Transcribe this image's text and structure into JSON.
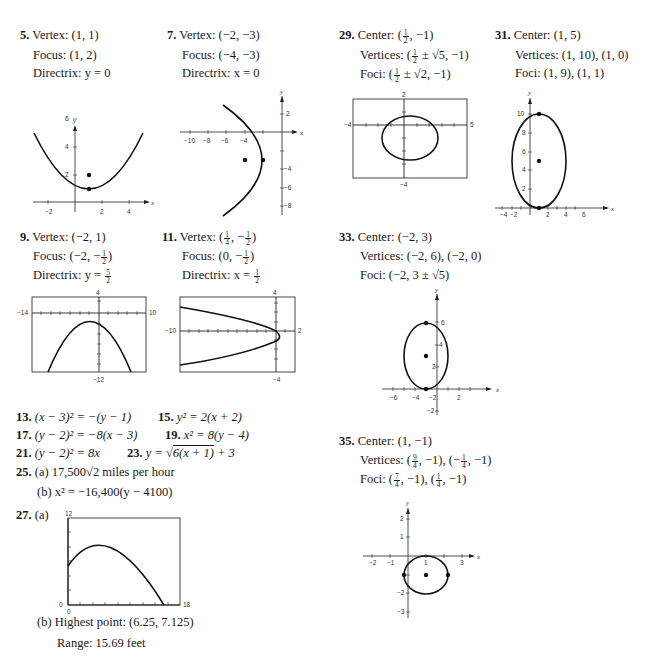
{
  "problems": {
    "p5": {
      "num": "5.",
      "l1": "Vertex: (1, 1)",
      "l2": "Focus: (1, 2)",
      "l3": "Directrix: y = 0"
    },
    "p7": {
      "num": "7.",
      "l1": "Vertex: (−2, −3)",
      "l2": "Focus: (−4, −3)",
      "l3": "Directrix: x = 0"
    },
    "p9": {
      "num": "9.",
      "l1": "Vertex: (−2, 1)",
      "l2_pre": "Focus: (−2, −",
      "l2_fn": "1",
      "l2_fd": "2",
      "l2_post": ")",
      "l3_pre": "Directrix: y = ",
      "l3_fn": "5",
      "l3_fd": "2"
    },
    "p11": {
      "num": "11.",
      "l1_pre": "Vertex: (",
      "l1_fn": "1",
      "l1_fd": "4",
      "l1_mid": ", −",
      "l1_fn2": "1",
      "l1_fd2": "2",
      "l1_post": ")",
      "l2_pre": "Focus: (0, −",
      "l2_fn": "1",
      "l2_fd": "2",
      "l2_post": ")",
      "l3_pre": "Directrix: x = ",
      "l3_fn": "1",
      "l3_fd": "2"
    },
    "p13": {
      "num": "13.",
      "text": "(x − 3)² = −(y − 1)"
    },
    "p15": {
      "num": "15.",
      "text": "y² = 2(x + 2)"
    },
    "p17": {
      "num": "17.",
      "text": "(y − 2)² = −8(x − 3)"
    },
    "p19": {
      "num": "19.",
      "text": "x² = 8(y − 4)"
    },
    "p21": {
      "num": "21.",
      "text": "(y − 2)² = 8x"
    },
    "p23": {
      "num": "23.",
      "pre": "y = √",
      "rad": "6(x + 1)",
      "post": " + 3"
    },
    "p25": {
      "num": "25.",
      "a": "(a)  17,500√2 miles per hour",
      "b": "(b)  x² = −16,400(y − 4100)"
    },
    "p27": {
      "num": "27.",
      "a": "(a)",
      "b1": "(b)  Highest point:  (6.25, 7.125)",
      "b2": "Range: 15.69 feet"
    },
    "p29": {
      "num": "29.",
      "l1_pre": "Center: (",
      "l1_fn": "1",
      "l1_fd": "2",
      "l1_post": ", −1)",
      "l2_pre": "Vertices: (",
      "l2_fn": "1",
      "l2_fd": "2",
      "l2_post": " ± √5, −1)",
      "l3_pre": "Foci: (",
      "l3_fn": "1",
      "l3_fd": "2",
      "l3_post": " ± √2, −1)"
    },
    "p31": {
      "num": "31.",
      "l1": "Center: (1, 5)",
      "l2": "Vertices: (1, 10),  (1, 0)",
      "l3": "Foci: (1, 9),  (1, 1)"
    },
    "p33": {
      "num": "33.",
      "l1": "Center: (−2, 3)",
      "l2": "Vertices: (−2, 6),  (−2, 0)",
      "l3": "Foci: (−2, 3 ± √5)"
    },
    "p35": {
      "num": "35.",
      "l1": "Center: (1, −1)",
      "l2_pre": "Vertices: (",
      "l2_fn": "9",
      "l2_fd": "4",
      "l2_mid": ", −1),  (−",
      "l2_fn2": "1",
      "l2_fd2": "4",
      "l2_post": ", −1)",
      "l3_pre": "Foci: (",
      "l3_fn": "7",
      "l3_fd": "4",
      "l3_mid": ", −1),  (",
      "l3_fn2": "1",
      "l3_fd2": "4",
      "l3_post": ", −1)"
    }
  },
  "graphs": {
    "g5": {
      "y_ticks": [
        "6",
        "4",
        "2"
      ],
      "x_ticks": [
        "−2",
        "2",
        "4"
      ],
      "xl": "x",
      "yl": "y"
    },
    "g7": {
      "y_ticks": [
        "2",
        "−4",
        "−6",
        "−8"
      ],
      "x_ticks": [
        "−10",
        "−8",
        "−6",
        "−4"
      ],
      "xl": "x",
      "yl": "y"
    },
    "g9": {
      "top": "4",
      "left": "−14",
      "right": "10",
      "bottom": "−12"
    },
    "g11": {
      "top": "4",
      "left": "−10",
      "right": "2",
      "bottom": "−4"
    },
    "g27": {
      "top": "12",
      "left": "0",
      "right": "18",
      "bottom": "0"
    },
    "g29": {
      "top": "2",
      "left": "−4",
      "right": "5",
      "bottom": "−4"
    },
    "g31": {
      "y_ticks": [
        "10",
        "8",
        "6",
        "4",
        "2"
      ],
      "x_ticks": [
        "−4",
        "−2",
        "2",
        "4",
        "6"
      ],
      "xl": "x",
      "yl": "y"
    },
    "g33": {
      "y_ticks": [
        "6",
        "4",
        "2",
        "−2"
      ],
      "x_ticks": [
        "−6",
        "−4",
        "−2",
        "2"
      ],
      "xl": "x",
      "yl": "y"
    },
    "g35": {
      "y_ticks": [
        "2",
        "1",
        "−2",
        "−3"
      ],
      "x_ticks": [
        "−2",
        "−1",
        "1",
        "3"
      ],
      "xl": "x",
      "yl": "y"
    }
  }
}
